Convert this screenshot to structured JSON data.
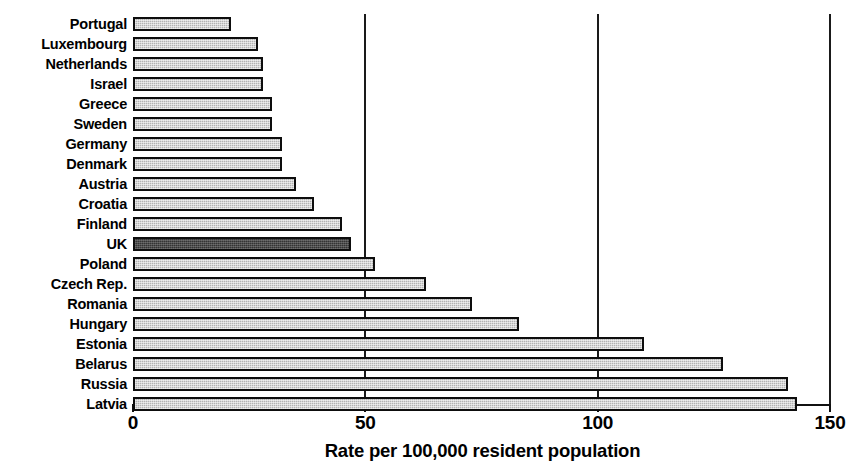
{
  "chart_data": {
    "type": "bar",
    "orientation": "horizontal",
    "title": "",
    "xlabel": "Rate per 100,000 resident population",
    "ylabel": "",
    "xlim": [
      0,
      150
    ],
    "xticks": [
      0,
      50,
      100,
      150
    ],
    "xtick_labels": [
      "0",
      "50",
      "100",
      "150"
    ],
    "grid": "vertical",
    "legend": "none",
    "categories": [
      "Portugal",
      "Luxembourg",
      "Netherlands",
      "Israel",
      "Greece",
      "Sweden",
      "Germany",
      "Denmark",
      "Austria",
      "Croatia",
      "Finland",
      "UK",
      "Poland",
      "Czech Rep.",
      "Romania",
      "Hungary",
      "Estonia",
      "Belarus",
      "Russia",
      "Latvia"
    ],
    "values": [
      21,
      27,
      28,
      28,
      30,
      30,
      32,
      32,
      35,
      39,
      45,
      47,
      52,
      63,
      73,
      83,
      110,
      127,
      141,
      143
    ],
    "highlight_category": "UK",
    "colors": {
      "bar_fill": "#b2b2b2",
      "bar_edge": "#0d0d0d",
      "highlight_fill": "#343434",
      "gridline": "#1a1a1a",
      "text": "#000000",
      "background": "#ffffff"
    }
  }
}
